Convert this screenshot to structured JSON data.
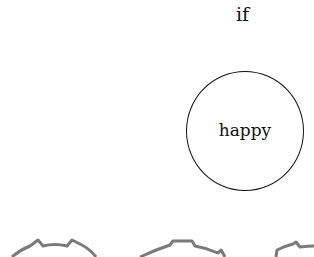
{
  "diagram": {
    "condition_label": "if",
    "node": {
      "label": "happy",
      "shape": "circle",
      "stroke_color": "#111111"
    },
    "gears": [
      {
        "name": "gear-left",
        "color": "#7a7a7a"
      },
      {
        "name": "gear-center",
        "color": "#7a7a7a"
      },
      {
        "name": "gear-right",
        "color": "#7a7a7a"
      }
    ]
  }
}
